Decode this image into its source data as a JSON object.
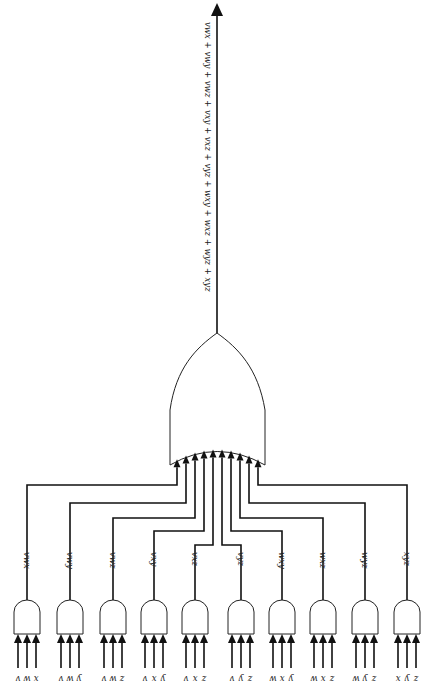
{
  "diagram": {
    "type": "logic-circuit",
    "orientation": "rotated-180",
    "output_expression": "vwx + vwy + vwz + vxy + vxz + vyz + wxy + wxz + wyz + xyz",
    "or_gate": {
      "label": "OR",
      "input_count": 10
    },
    "and_gates": [
      {
        "id": "g1",
        "term": "vwx",
        "inputs": [
          "v",
          "w",
          "x"
        ],
        "cx": 27,
        "wire_y": 485
      },
      {
        "id": "g2",
        "term": "vwy",
        "inputs": [
          "v",
          "w",
          "y"
        ],
        "cx": 70,
        "wire_y": 503
      },
      {
        "id": "g3",
        "term": "vwz",
        "inputs": [
          "v",
          "w",
          "z"
        ],
        "cx": 113,
        "wire_y": 518
      },
      {
        "id": "g4",
        "term": "vxy",
        "inputs": [
          "v",
          "x",
          "y"
        ],
        "cx": 154,
        "wire_y": 531
      },
      {
        "id": "g5",
        "term": "vxz",
        "inputs": [
          "v",
          "x",
          "z"
        ],
        "cx": 195,
        "wire_y": 545
      },
      {
        "id": "g6",
        "term": "vyz",
        "inputs": [
          "v",
          "y",
          "z"
        ],
        "cx": 241,
        "wire_y": 545
      },
      {
        "id": "g7",
        "term": "wxy",
        "inputs": [
          "w",
          "x",
          "y"
        ],
        "cx": 282,
        "wire_y": 531
      },
      {
        "id": "g8",
        "term": "wxz",
        "inputs": [
          "w",
          "x",
          "z"
        ],
        "cx": 323,
        "wire_y": 518
      },
      {
        "id": "g9",
        "term": "wyz",
        "inputs": [
          "w",
          "y",
          "z"
        ],
        "cx": 365,
        "wire_y": 503
      },
      {
        "id": "g10",
        "term": "xyz",
        "inputs": [
          "x",
          "y",
          "z"
        ],
        "cx": 407,
        "wire_y": 485
      }
    ],
    "or_inputs_x": [
      177,
      186,
      195,
      204,
      213,
      222,
      231,
      240,
      249,
      258
    ],
    "colors": {
      "line": "#111111",
      "background": "#ffffff"
    }
  }
}
